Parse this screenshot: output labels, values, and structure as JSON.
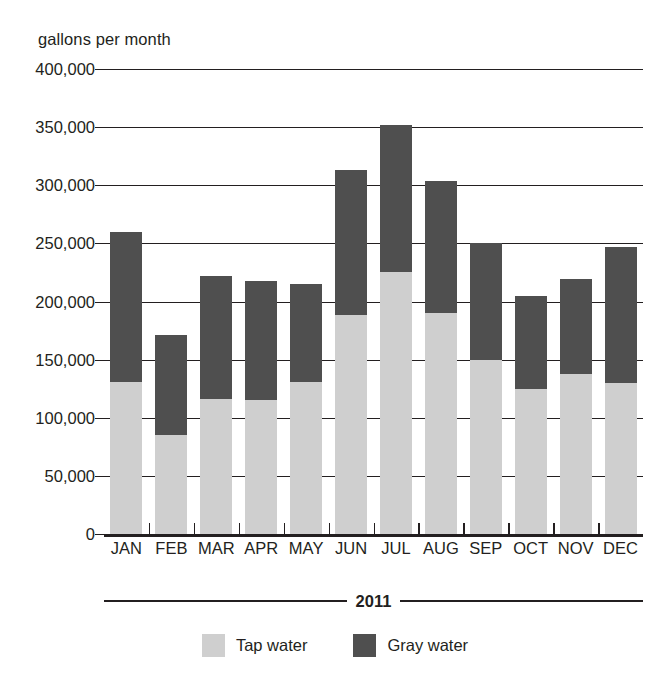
{
  "chart_data": {
    "type": "bar",
    "stacked": true,
    "title": "",
    "subtitle": "",
    "ylabel": "gallons per month",
    "xlabel": "2011",
    "ylim": [
      0,
      400000
    ],
    "ytick_values": [
      0,
      50000,
      100000,
      150000,
      200000,
      250000,
      300000,
      350000,
      400000
    ],
    "ytick_labels": [
      "0",
      "50,000",
      "100,000",
      "150,000",
      "200,000",
      "250,000",
      "300,000",
      "350,000",
      "400,000"
    ],
    "grid": true,
    "legend_position": "bottom-center",
    "categories": [
      "JAN",
      "FEB",
      "MAR",
      "APR",
      "MAY",
      "JUN",
      "JUL",
      "AUG",
      "SEP",
      "OCT",
      "NOV",
      "DEC"
    ],
    "series": [
      {
        "name": "Tap water",
        "color": "#cfcfcf",
        "values": [
          131000,
          85000,
          116000,
          115000,
          131000,
          188000,
          225000,
          190000,
          150000,
          125000,
          138000,
          130000
        ]
      },
      {
        "name": "Gray water",
        "color": "#4f4f4f",
        "values": [
          129000,
          86000,
          106000,
          103000,
          84000,
          125000,
          127000,
          114000,
          100000,
          80000,
          81000,
          117000
        ]
      }
    ],
    "totals": [
      260000,
      171000,
      222000,
      218000,
      215000,
      313000,
      352000,
      304000,
      250000,
      205000,
      219000,
      247000
    ]
  },
  "legend": {
    "items": [
      {
        "label": "Tap water",
        "color": "#cfcfcf"
      },
      {
        "label": "Gray water",
        "color": "#4f4f4f"
      }
    ]
  },
  "axis": {
    "y_caption": "gallons per month",
    "x_caption": "2011"
  }
}
